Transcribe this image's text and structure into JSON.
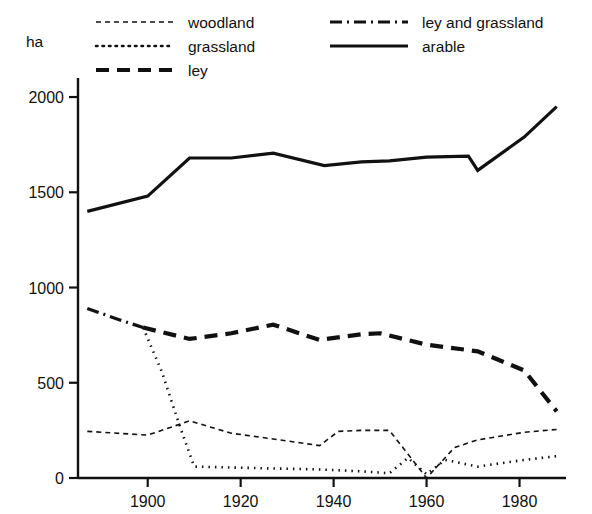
{
  "chart_data": {
    "type": "line",
    "title": "",
    "xlabel": "",
    "ylabel": "ha",
    "unit_label": "ha",
    "xlim": [
      1885,
      1990
    ],
    "ylim": [
      0,
      2100
    ],
    "grid": false,
    "legend_position": "top",
    "x_ticks": [
      "1900",
      "1920",
      "1940",
      "1960",
      "1980"
    ],
    "x_tick_values": [
      1900,
      1920,
      1940,
      1960,
      1980
    ],
    "y_ticks": [
      "0",
      "500",
      "1000",
      "1500",
      "2000"
    ],
    "y_tick_values": [
      0,
      500,
      1000,
      1500,
      2000
    ],
    "series": [
      {
        "name": "woodland",
        "style": "fine-dashed",
        "dasharray": "5,4",
        "width": 1.6,
        "x": [
          1887,
          1900,
          1909,
          1918,
          1927,
          1937,
          1941,
          1946,
          1952,
          1960,
          1966,
          1971,
          1981,
          1988
        ],
        "values": [
          245,
          225,
          300,
          235,
          205,
          170,
          245,
          250,
          250,
          0,
          160,
          200,
          240,
          255
        ]
      },
      {
        "name": "grassland",
        "style": "dotted",
        "dasharray": "1.5,5",
        "width": 2.6,
        "x": [
          1899,
          1903,
          1907,
          1910,
          1918,
          1927,
          1937,
          1946,
          1952,
          1956,
          1960,
          1964,
          1971,
          1981,
          1988
        ],
        "values": [
          790,
          560,
          265,
          60,
          55,
          50,
          45,
          35,
          25,
          105,
          20,
          95,
          60,
          95,
          115
        ]
      },
      {
        "name": "ley",
        "style": "bold-dashed",
        "dasharray": "13,8",
        "width": 4.2,
        "x": [
          1899,
          1909,
          1918,
          1927,
          1937,
          1946,
          1950,
          1960,
          1971,
          1981,
          1988
        ],
        "values": [
          790,
          730,
          760,
          805,
          725,
          755,
          760,
          700,
          665,
          565,
          350
        ]
      },
      {
        "name": "ley and grassland",
        "style": "dash-dot",
        "dasharray": "12,5,2,5",
        "width": 3.2,
        "x": [
          1887,
          1894,
          1899
        ],
        "values": [
          890,
          830,
          790
        ]
      },
      {
        "name": "arable",
        "style": "solid",
        "dasharray": "none",
        "width": 3.2,
        "x": [
          1887,
          1900,
          1909,
          1918,
          1927,
          1938,
          1946,
          1952,
          1960,
          1969,
          1971,
          1981,
          1988
        ],
        "values": [
          1400,
          1480,
          1680,
          1680,
          1705,
          1640,
          1660,
          1665,
          1685,
          1690,
          1615,
          1790,
          1950
        ]
      }
    ]
  },
  "legend": {
    "entries": [
      {
        "label": "woodland",
        "series": "woodland",
        "col": 0,
        "row": 0
      },
      {
        "label": "grassland",
        "series": "grassland",
        "col": 0,
        "row": 1
      },
      {
        "label": "ley",
        "series": "ley",
        "col": 0,
        "row": 2
      },
      {
        "label": "ley and grassland",
        "series": "ley and grassland",
        "col": 1,
        "row": 0
      },
      {
        "label": "arable",
        "series": "arable",
        "col": 1,
        "row": 1
      }
    ]
  },
  "colors": {
    "ink": "#111111",
    "background": "#ffffff"
  }
}
